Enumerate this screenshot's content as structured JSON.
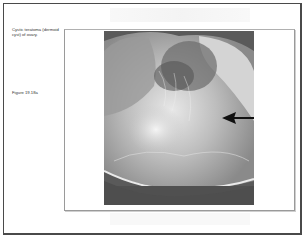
{
  "slide": {
    "caption": "Cystic teratoma (dermoid cyst) of ovary.",
    "figure_label": "Figure 19.18a"
  },
  "figure": {
    "image_description": "Grayscale photograph of opened ovarian cyst with hair and sebaceous material",
    "annotation": "arrow-left-pointing"
  }
}
